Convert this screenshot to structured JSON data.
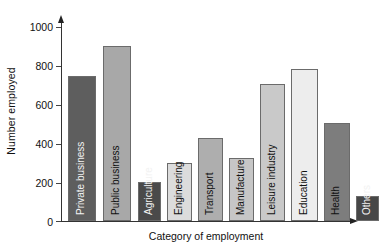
{
  "chart_data": {
    "type": "bar",
    "title": "",
    "xlabel": "Category of employment",
    "ylabel": "Number employed",
    "categories": [
      "Private business",
      "Public business",
      "Agriculture",
      "Engineering",
      "Transport",
      "Manufacture",
      "Leisure industry",
      "Education",
      "Health",
      "Others"
    ],
    "values": [
      750,
      900,
      200,
      300,
      430,
      325,
      705,
      785,
      505,
      130
    ],
    "bar_colors": [
      "#5e5e5e",
      "#a8a8a8",
      "#4a4a4a",
      "#dcdcdc",
      "#aeaeae",
      "#c6c6c6",
      "#c9c9c9",
      "#ededed",
      "#7d7d7d",
      "#474747"
    ],
    "bar_border_color": "#6b6b6b",
    "ylim": [
      0,
      1000
    ],
    "yticks": [
      0,
      200,
      400,
      600,
      800,
      1000
    ],
    "ytick_labels": [
      "0",
      "200",
      "400",
      "600",
      "800",
      "1000"
    ],
    "grid": false,
    "legend": "none",
    "axis_color": "#333333"
  }
}
